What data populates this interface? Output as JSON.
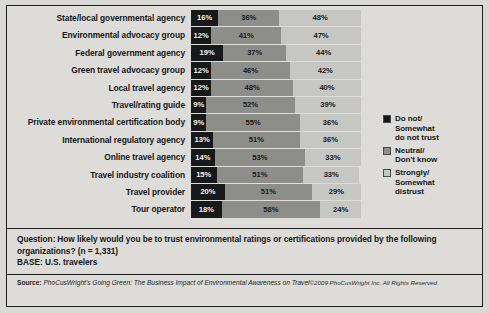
{
  "chart_data": {
    "type": "bar",
    "subtype": "stacked-horizontal-100pct",
    "title": "",
    "xlabel": "",
    "ylabel": "",
    "xlim": [
      0,
      100
    ],
    "grid": false,
    "legend_position": "right",
    "categories": [
      "State/local governmental agency",
      "Environmental advocacy group",
      "Federal government agency",
      "Green travel advocacy group",
      "Local travel agency",
      "Travel/rating guide",
      "Private environmental certification body",
      "International regulatory agency",
      "Online travel agency",
      "Travel industry coalition",
      "Travel provider",
      "Tour operator"
    ],
    "series": [
      {
        "name": "Do not/Somewhat do not trust",
        "color": "#17181a",
        "values": [
          16,
          12,
          19,
          12,
          12,
          9,
          9,
          13,
          14,
          15,
          20,
          18
        ]
      },
      {
        "name": "Neutral/Don't know",
        "color": "#8d8d8a",
        "values": [
          36,
          41,
          37,
          46,
          48,
          52,
          55,
          51,
          53,
          51,
          51,
          58
        ]
      },
      {
        "name": "Strongly/Somewhat distrust",
        "color": "#c6c6c2",
        "values": [
          48,
          47,
          44,
          42,
          40,
          39,
          36,
          36,
          33,
          33,
          29,
          24
        ]
      }
    ],
    "value_suffix": "%"
  },
  "legend": {
    "items": [
      {
        "label": "Do not/\nSomewhat\ndo not trust",
        "swatch": "s1"
      },
      {
        "label": "Neutral/\nDon't know",
        "swatch": "s2"
      },
      {
        "label": "Strongly/\nSomewhat\ndistrust",
        "swatch": "s3"
      }
    ]
  },
  "footer": {
    "question_label": "Question:",
    "question_text": "How likely would you be to trust environmental ratings or certifications provided by the following organizations? (n = 1,331)",
    "base_line": "BASE: U.S. travelers",
    "source_label": "Source:",
    "source_body": "PhoCusWright's Going Green: The Business Impact of Environmental Awareness on Travel",
    "copyright": "©2009 PhoCusWright Inc. All Rights Reserved."
  }
}
